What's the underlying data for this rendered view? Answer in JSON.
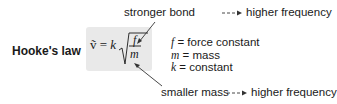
{
  "title": "Hooke's law",
  "formula": {
    "lhs": "ṽ = ",
    "k": "k",
    "numerator": "f",
    "denominator": "m"
  },
  "annotations": {
    "top": {
      "cause": "stronger bond",
      "effect": "higher frequency"
    },
    "bottom": {
      "cause": "smaller mass",
      "effect": "higher frequency"
    }
  },
  "definitions": [
    {
      "symbol": "f",
      "meaning": " = force constant"
    },
    {
      "symbol": "m",
      "meaning": " = mass"
    },
    {
      "symbol": "k",
      "meaning": " = constant"
    }
  ],
  "colors": {
    "box": "#e9e9e9",
    "text": "#1a1a1a",
    "arrow": "#333333"
  }
}
